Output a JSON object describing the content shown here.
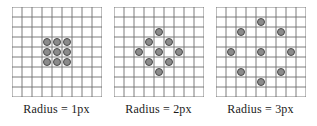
{
  "figure": {
    "grid": {
      "cols": 9,
      "rows": 9,
      "cell_px": 10,
      "line_color": "#6e6e6e",
      "background": "#ffffff"
    },
    "dot_style": {
      "fill": "#8b8b8b",
      "stroke": "#4a4a4a",
      "diameter_px": 8
    }
  },
  "panels": [
    {
      "id": "panel-radius-1",
      "caption": "Radius = 1px",
      "radius": 1,
      "dot_count": 9,
      "pattern": "filled 3x3 block",
      "dots": [
        {
          "col": 3,
          "row": 3
        },
        {
          "col": 4,
          "row": 3
        },
        {
          "col": 5,
          "row": 3
        },
        {
          "col": 3,
          "row": 4
        },
        {
          "col": 4,
          "row": 4
        },
        {
          "col": 5,
          "row": 4
        },
        {
          "col": 3,
          "row": 5
        },
        {
          "col": 4,
          "row": 5
        },
        {
          "col": 5,
          "row": 5
        }
      ]
    },
    {
      "id": "panel-radius-2",
      "caption": "Radius = 2px",
      "radius": 2,
      "dot_count": 9,
      "pattern": "diamond ring with centre",
      "dots": [
        {
          "col": 4,
          "row": 2
        },
        {
          "col": 3,
          "row": 3
        },
        {
          "col": 5,
          "row": 3
        },
        {
          "col": 2,
          "row": 4
        },
        {
          "col": 4,
          "row": 4
        },
        {
          "col": 6,
          "row": 4
        },
        {
          "col": 3,
          "row": 5
        },
        {
          "col": 5,
          "row": 5
        },
        {
          "col": 4,
          "row": 6
        }
      ]
    },
    {
      "id": "panel-radius-3",
      "caption": "Radius = 3px",
      "radius": 3,
      "dot_count": 9,
      "pattern": "wide circular ring with centre",
      "dots": [
        {
          "col": 4,
          "row": 1
        },
        {
          "col": 2,
          "row": 2
        },
        {
          "col": 6,
          "row": 2
        },
        {
          "col": 1,
          "row": 4
        },
        {
          "col": 4,
          "row": 4
        },
        {
          "col": 7,
          "row": 4
        },
        {
          "col": 2,
          "row": 6
        },
        {
          "col": 6,
          "row": 6
        },
        {
          "col": 4,
          "row": 7
        }
      ]
    }
  ]
}
